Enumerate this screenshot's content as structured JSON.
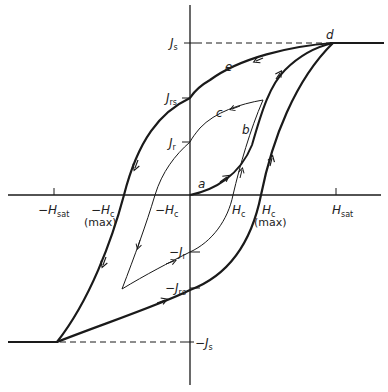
{
  "axes": {
    "x_ticks": [
      {
        "id": "neg_hsat",
        "sign": "−",
        "main": "H",
        "sub": "sat",
        "extra": ""
      },
      {
        "id": "neg_hc_max",
        "sign": "−",
        "main": "H",
        "sub": "c",
        "extra": "(max)"
      },
      {
        "id": "neg_hc",
        "sign": "−",
        "main": "H",
        "sub": "c",
        "extra": ""
      },
      {
        "id": "hc",
        "sign": "",
        "main": "H",
        "sub": "c",
        "extra": ""
      },
      {
        "id": "hc_max",
        "sign": "",
        "main": "H",
        "sub": "c",
        "extra": "(max)"
      },
      {
        "id": "hsat",
        "sign": "",
        "main": "H",
        "sub": "sat",
        "extra": ""
      }
    ],
    "y_ticks": [
      {
        "id": "js",
        "sign": "",
        "main": "J",
        "sub": "s"
      },
      {
        "id": "jrs",
        "sign": "",
        "main": "J",
        "sub": "rs"
      },
      {
        "id": "jr",
        "sign": "",
        "main": "J",
        "sub": "r"
      },
      {
        "id": "neg_jr",
        "sign": "−",
        "main": "J",
        "sub": "r"
      },
      {
        "id": "neg_jrs",
        "sign": "−",
        "main": "J",
        "sub": "rs"
      },
      {
        "id": "neg_js",
        "sign": "−",
        "main": "J",
        "sub": "s"
      }
    ]
  },
  "curve_labels": {
    "a": "a",
    "b": "b",
    "c": "c",
    "d": "d",
    "e": "e"
  },
  "colors": {
    "line": "#1a1a1a",
    "background": "#ffffff"
  }
}
